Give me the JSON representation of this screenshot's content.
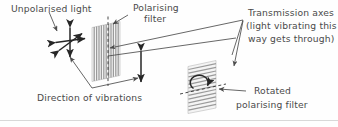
{
  "figure": {
    "background_color": "#fefefe",
    "text_color": "#4a4a4a",
    "stroke_color": "#262626",
    "stripe_color": "#9a9a9a",
    "panel_fill": "#f4f4f4",
    "rule_color": "#d8d8d8"
  },
  "labels": {
    "unpolarised_light": "Unpolarised light",
    "polarising_filter_line1": "Polarising",
    "polarising_filter_line2": "filter",
    "transmission_axes_line1": "Transmission axes",
    "transmission_axes_line2": "(light vibrating this",
    "transmission_axes_line3": "way gets through)",
    "direction_of_vibrations": "Direction of vibrations",
    "rotated_filter_line1": "Rotated",
    "rotated_filter_line2": "polarising filter"
  },
  "icons": {
    "unpolarised_star": "multi-direction-arrow-star-icon",
    "polarised_arrow": "vertical-double-arrow-icon",
    "rotation_arrow": "curved-rotation-arrow-icon",
    "first_filter": "vertical-stripe-filter-icon",
    "second_filter": "horizontal-stripe-filter-icon",
    "transmission_axis_dashed": "dashed-axis-line-icon"
  }
}
